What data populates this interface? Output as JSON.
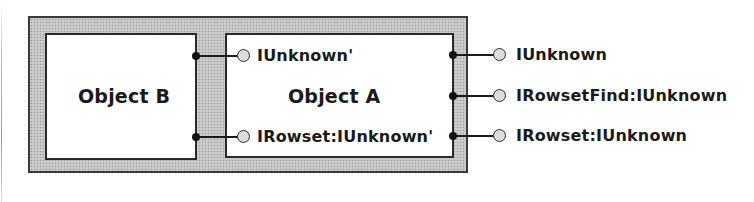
{
  "diagram": {
    "type": "COM aggregation diagram",
    "container": {
      "fill": "#c4c4c4",
      "border": "#3a3a3a"
    },
    "objects": [
      {
        "id": "object-b",
        "label": "Object B"
      },
      {
        "id": "object-a",
        "label": "Object A"
      }
    ],
    "object_a_inner_interfaces": [
      {
        "label": "IUnknown'"
      },
      {
        "label": "IRowset:IUnknown'"
      }
    ],
    "exposed_interfaces": [
      {
        "label": "IUnknown"
      },
      {
        "label": "IRowsetFind:IUnknown"
      },
      {
        "label": "IRowset:IUnknown"
      }
    ],
    "connections": [
      {
        "from": "Object B",
        "to": "IUnknown'"
      },
      {
        "from": "Object B",
        "to": "IRowset:IUnknown'"
      },
      {
        "from": "Object A",
        "to": "IUnknown"
      },
      {
        "from": "Object A",
        "to": "IRowsetFind:IUnknown"
      },
      {
        "from": "Object A",
        "to": "IRowset:IUnknown"
      }
    ]
  }
}
